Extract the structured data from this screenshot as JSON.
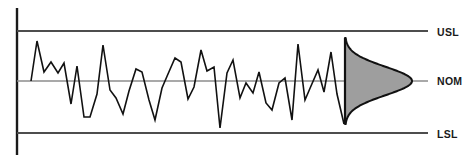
{
  "figure": {
    "type": "process-capability-run-chart",
    "background_color": "#ffffff",
    "width": 472,
    "height": 162
  },
  "labels": {
    "usl": "USL",
    "nom": "NOM",
    "lsl": "LSL"
  },
  "colors": {
    "limit_line": "#4d4d4d",
    "nominal_line": "#8c8c8c",
    "axis": "#1a1a1a",
    "data_line": "#111111",
    "distribution_fill": "#9e9e9e",
    "distribution_stroke": "#111111",
    "text": "#1a1a1a"
  },
  "chart_data": {
    "type": "line",
    "title": "",
    "subtitle": "",
    "xlabel": "",
    "ylabel": "",
    "grid": false,
    "legend_position": "right",
    "axis": {
      "vertical_axis_x": 17,
      "vertical_axis_y_top": 8,
      "vertical_axis_y_bottom": 155,
      "plot_left": 17,
      "plot_right": 428
    },
    "reference_lines": [
      {
        "name": "USL",
        "label": "USL",
        "y_px": 31,
        "value": 1.0,
        "color": "#4d4d4d",
        "width_px": 2,
        "x_start": 17,
        "x_end": 428
      },
      {
        "name": "NOM",
        "label": "NOM",
        "y_px": 81,
        "value": 0.0,
        "color": "#8c8c8c",
        "width_px": 1.5,
        "x_start": 17,
        "x_end": 428
      },
      {
        "name": "LSL",
        "label": "LSL",
        "y_px": 133,
        "value": -1.0,
        "color": "#4d4d4d",
        "width_px": 2,
        "x_start": 17,
        "x_end": 428
      }
    ],
    "ylim": [
      -1.45,
      1.45
    ],
    "ytick_values": [
      1.0,
      0.0,
      -1.0
    ],
    "ytick_labels": [
      "USL",
      "NOM",
      "LSL"
    ],
    "series": [
      {
        "name": "process-measurements",
        "color": "#111111",
        "x": [
          31,
          37,
          44,
          51,
          58,
          64,
          71,
          77,
          84,
          90,
          97,
          103,
          110,
          116,
          123,
          129,
          136,
          142,
          149,
          155,
          162,
          168,
          175,
          181,
          188,
          194,
          201,
          207,
          214,
          220,
          227,
          233,
          240,
          246,
          253,
          259,
          266,
          272,
          279,
          285,
          292,
          298,
          305,
          311,
          318,
          324,
          331,
          337,
          344
        ],
        "y_px": [
          81,
          41,
          72,
          62,
          73,
          63,
          104,
          66,
          117,
          117,
          94,
          45,
          90,
          98,
          114,
          91,
          69,
          72,
          100,
          120,
          88,
          74,
          58,
          62,
          99,
          87,
          50,
          71,
          67,
          128,
          73,
          60,
          98,
          83,
          93,
          72,
          103,
          110,
          83,
          78,
          120,
          44,
          100,
          86,
          70,
          92,
          52,
          94,
          124
        ],
        "values": [
          0.0,
          0.8,
          0.18,
          0.38,
          0.16,
          0.36,
          -0.46,
          0.3,
          -0.72,
          -0.72,
          -0.26,
          0.72,
          -0.18,
          -0.34,
          -0.66,
          -0.2,
          0.24,
          0.18,
          -0.38,
          -0.78,
          -0.14,
          0.14,
          0.46,
          0.38,
          -0.36,
          -0.12,
          0.62,
          0.2,
          0.28,
          -0.94,
          0.16,
          0.42,
          -0.34,
          -0.04,
          -0.24,
          0.18,
          -0.44,
          -0.58,
          -0.04,
          0.06,
          -0.78,
          0.74,
          -0.38,
          -0.1,
          0.22,
          -0.22,
          0.58,
          -0.26,
          -0.86
        ]
      }
    ],
    "distribution": {
      "name": "capability-distribution",
      "orientation": "horizontal-bell",
      "baseline_x_px": 345,
      "peak_x_px": 412,
      "center_y_px": 81,
      "top_y_px": 38,
      "bottom_y_px": 124,
      "fill": "#9e9e9e",
      "stroke": "#111111",
      "mean": 0.0,
      "sigma": 0.33
    }
  }
}
